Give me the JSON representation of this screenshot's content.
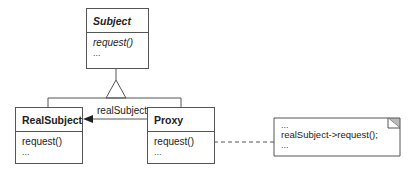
{
  "diagram": {
    "type": "uml-class-diagram",
    "classes": [
      {
        "id": "subject",
        "name": "Subject",
        "abstract": true,
        "members": [
          "request()",
          "..."
        ]
      },
      {
        "id": "realsubject",
        "name": "RealSubject",
        "abstract": false,
        "members": [
          "request()",
          "..."
        ]
      },
      {
        "id": "proxy",
        "name": "Proxy",
        "abstract": false,
        "members": [
          "request()",
          "..."
        ]
      }
    ],
    "association": {
      "from": "proxy",
      "to": "realsubject",
      "label": "realSubject"
    },
    "note": {
      "lines": [
        "...",
        "realSubject->request();",
        "..."
      ]
    }
  },
  "colors": {
    "line": "#555555",
    "note_corner": "#bbbbbb"
  }
}
